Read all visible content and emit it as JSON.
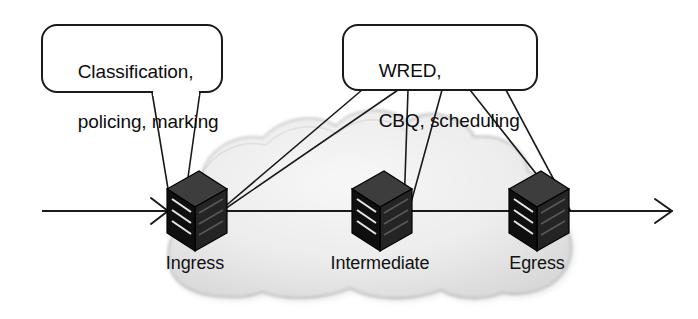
{
  "figure": {
    "width": 698,
    "height": 319,
    "background_color": "#ffffff"
  },
  "callouts": [
    {
      "id": "ingress-functions",
      "line1": "Classification,",
      "line2": "policing, marking",
      "box": {
        "x": 42,
        "y": 25,
        "width": 180,
        "height": 67,
        "radius": 14
      },
      "stroke_color": "#1a1a1a",
      "fill_color": "#ffffff",
      "targets": [
        "ingress"
      ]
    },
    {
      "id": "core-functions",
      "line1": "WRED,",
      "line2": "CBQ, scheduling",
      "box": {
        "x": 343,
        "y": 25,
        "width": 194,
        "height": 65,
        "radius": 14
      },
      "stroke_color": "#1a1a1a",
      "fill_color": "#ffffff",
      "targets": [
        "ingress",
        "intermediate",
        "egress"
      ]
    }
  ],
  "cloud": {
    "label": "service provider network cloud",
    "fill_color": "#ebebeb",
    "edge_color": "#8a8a8a",
    "bounds": {
      "x": 165,
      "y": 123,
      "width": 412,
      "height": 178
    }
  },
  "trunk": {
    "y": 211,
    "x_start": 42,
    "x_end": 672,
    "color": "#1a1a1a",
    "left_arrow": true,
    "right_arrow": true
  },
  "routers": [
    {
      "id": "ingress",
      "label": "Ingress",
      "x": 195,
      "y": 211,
      "label_x": 195,
      "label_y": 253
    },
    {
      "id": "intermediate",
      "label": "Intermediate",
      "x": 380,
      "y": 211,
      "label_x": 380,
      "label_y": 253
    },
    {
      "id": "egress",
      "label": "Egress",
      "x": 537,
      "y": 211,
      "label_x": 537,
      "label_y": 253
    }
  ],
  "router_style": {
    "front_face_color": "#111111",
    "top_face_color": "#3a3a3a",
    "side_face_color": "#262626",
    "slot_color": "#e8e8e8",
    "outline_color": "#000000"
  },
  "leader_lines": {
    "color": "#1a1a1a",
    "width": 1.6
  }
}
